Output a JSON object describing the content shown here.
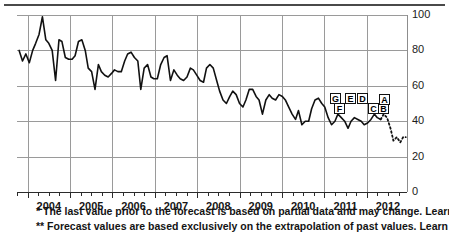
{
  "chart_data": {
    "type": "line",
    "title": "",
    "subtitle": "",
    "xlabel": "",
    "ylabel": "",
    "ylim": [
      0,
      100
    ],
    "yticks": [
      0,
      20,
      40,
      60,
      80,
      100
    ],
    "xlim": [
      2003.75,
      2012.95
    ],
    "xticks": [
      2004,
      2005,
      2006,
      2007,
      2008,
      2009,
      2010,
      2011,
      2012
    ],
    "xtick_labels": [
      "2004",
      "2005",
      "2006",
      "2007",
      "2008",
      "2009",
      "2010",
      "2011",
      "2012"
    ],
    "grid": true,
    "legend_position": "none",
    "series": [
      {
        "name": "Actual",
        "style": "solid",
        "color": "#111111",
        "x": [
          2003.8,
          2003.88,
          2003.96,
          2004.04,
          2004.12,
          2004.19,
          2004.27,
          2004.35,
          2004.43,
          2004.5,
          2004.58,
          2004.66,
          2004.74,
          2004.81,
          2004.89,
          2004.97,
          2005.05,
          2005.12,
          2005.2,
          2005.28,
          2005.36,
          2005.43,
          2005.51,
          2005.59,
          2005.67,
          2005.74,
          2005.82,
          2005.9,
          2005.98,
          2006.05,
          2006.13,
          2006.21,
          2006.29,
          2006.36,
          2006.44,
          2006.52,
          2006.6,
          2006.67,
          2006.75,
          2006.83,
          2006.91,
          2006.98,
          2007.06,
          2007.14,
          2007.22,
          2007.29,
          2007.37,
          2007.45,
          2007.53,
          2007.6,
          2007.68,
          2007.76,
          2007.84,
          2007.91,
          2007.99,
          2008.07,
          2008.15,
          2008.22,
          2008.3,
          2008.38,
          2008.46,
          2008.53,
          2008.61,
          2008.69,
          2008.77,
          2008.84,
          2008.92,
          2009.0,
          2009.08,
          2009.15,
          2009.23,
          2009.31,
          2009.39,
          2009.46,
          2009.54,
          2009.62,
          2009.7,
          2009.77,
          2009.85,
          2009.93,
          2010.01,
          2010.08,
          2010.16,
          2010.24,
          2010.32,
          2010.39,
          2010.47,
          2010.55,
          2010.63,
          2010.7,
          2010.78,
          2010.86,
          2010.94,
          2011.01,
          2011.09,
          2011.17,
          2011.25,
          2011.32,
          2011.4,
          2011.48,
          2011.56,
          2011.63,
          2011.71,
          2011.79,
          2011.87,
          2011.94,
          2012.02,
          2012.1,
          2012.18,
          2012.25,
          2012.33
        ],
        "values": [
          80,
          74,
          78,
          73,
          80,
          84,
          89,
          99,
          86,
          84,
          80,
          63,
          86,
          85,
          76,
          75,
          75,
          77,
          85,
          86,
          80,
          70,
          68,
          58,
          72,
          68,
          66,
          65,
          67,
          69,
          68,
          68,
          74,
          78,
          79,
          76,
          74,
          58,
          70,
          72,
          65,
          64,
          64,
          72,
          76,
          77,
          63,
          69,
          66,
          64,
          63,
          65,
          70,
          69,
          66,
          63,
          62,
          70,
          72,
          70,
          63,
          57,
          52,
          50,
          54,
          57,
          55,
          50,
          48,
          52,
          58,
          58,
          54,
          52,
          44,
          52,
          55,
          53,
          52,
          55,
          54,
          52,
          48,
          44,
          41,
          46,
          38,
          40,
          40,
          47,
          52,
          53,
          50,
          48,
          42,
          38,
          40,
          44,
          42,
          40,
          36,
          40,
          42,
          41,
          40,
          38,
          39,
          41,
          44,
          42,
          41
        ]
      },
      {
        "name": "Forecast",
        "style": "dotted",
        "color": "#111111",
        "x": [
          2012.33,
          2012.4,
          2012.48,
          2012.56,
          2012.63,
          2012.71,
          2012.79,
          2012.86,
          2012.92
        ],
        "values": [
          41,
          44,
          42,
          36,
          29,
          31,
          28,
          31,
          31
        ]
      }
    ],
    "annotations": [
      {
        "label": "G",
        "x": 2010.7,
        "y": 52,
        "box_x": 330,
        "box_y": 93
      },
      {
        "label": "F",
        "x": 2010.78,
        "y": 45,
        "box_x": 334,
        "box_y": 103
      },
      {
        "label": "E",
        "x": 2011.01,
        "y": 52,
        "box_x": 345,
        "box_y": 93
      },
      {
        "label": "D",
        "x": 2011.17,
        "y": 52,
        "box_x": 357,
        "box_y": 93
      },
      {
        "label": "C",
        "x": 2011.71,
        "y": 44,
        "box_x": 368,
        "box_y": 103
      },
      {
        "label": "B",
        "x": 2011.87,
        "y": 43,
        "box_x": 378,
        "box_y": 103
      },
      {
        "label": "A",
        "x": 2011.94,
        "y": 48,
        "box_x": 379,
        "box_y": 94
      }
    ]
  },
  "footnotes": {
    "first": "* The last value prior to the forecast is based on partial data and may change. Learn more",
    "second": "** Forecast values are based exclusively on the extrapolation of past values. Learn more",
    "link_label": "Learn more"
  },
  "colors": {
    "line": "#111111",
    "grid": "#9a9a9a",
    "axis": "#2b2b2b",
    "text": "#141414",
    "rule": "#4a4a4a"
  }
}
